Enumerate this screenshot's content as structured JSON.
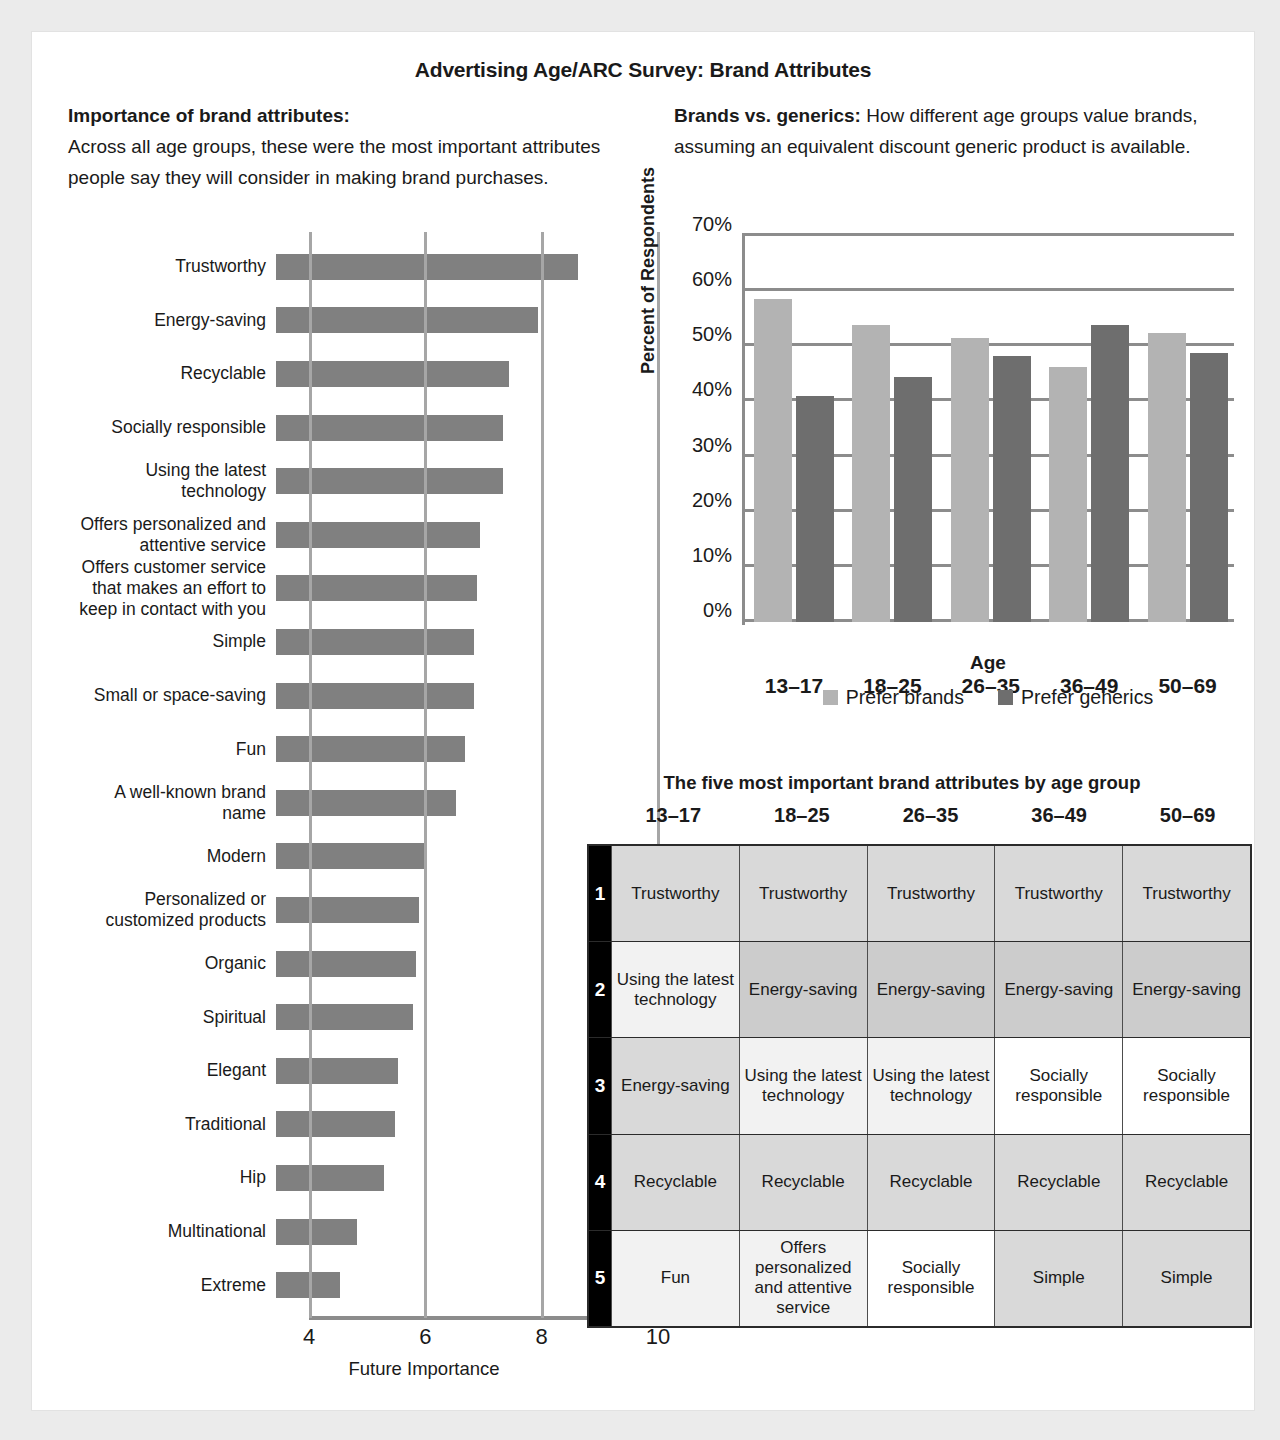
{
  "title": "Advertising Age/ARC Survey: Brand Attributes",
  "left_intro": {
    "heading": "Importance of brand attributes:",
    "body": "Across all age groups, these were the most important attributes people say they will consider in making brand purchases."
  },
  "right_intro": {
    "heading": "Brands vs. generics:",
    "body": " How different age groups value brands, assuming an equivalent discount generic product is available."
  },
  "table_section": {
    "title": "The five most important brand attributes by age group",
    "columns": [
      "13–17",
      "18–25",
      "26–35",
      "36–49",
      "50–69"
    ],
    "ranks": [
      "1",
      "2",
      "3",
      "4",
      "5"
    ],
    "rows": [
      {
        "rank": "1",
        "cells": [
          {
            "text": "Trustworthy",
            "shade": 2
          },
          {
            "text": "Trustworthy",
            "shade": 2
          },
          {
            "text": "Trustworthy",
            "shade": 2
          },
          {
            "text": "Trustworthy",
            "shade": 2
          },
          {
            "text": "Trustworthy",
            "shade": 2
          }
        ]
      },
      {
        "rank": "2",
        "cells": [
          {
            "text": "Using the latest technology",
            "shade": 1
          },
          {
            "text": "Energy-saving",
            "shade": 3
          },
          {
            "text": "Energy-saving",
            "shade": 3
          },
          {
            "text": "Energy-saving",
            "shade": 3
          },
          {
            "text": "Energy-saving",
            "shade": 3
          }
        ]
      },
      {
        "rank": "3",
        "cells": [
          {
            "text": "Energy-saving",
            "shade": 2
          },
          {
            "text": "Using the latest technology",
            "shade": 1
          },
          {
            "text": "Using the latest technology",
            "shade": 1
          },
          {
            "text": "Socially responsible",
            "shade": 0
          },
          {
            "text": "Socially responsible",
            "shade": 0
          }
        ]
      },
      {
        "rank": "4",
        "cells": [
          {
            "text": "Recyclable",
            "shade": 2
          },
          {
            "text": "Recyclable",
            "shade": 2
          },
          {
            "text": "Recyclable",
            "shade": 2
          },
          {
            "text": "Recyclable",
            "shade": 2
          },
          {
            "text": "Recyclable",
            "shade": 2
          }
        ]
      },
      {
        "rank": "5",
        "cells": [
          {
            "text": "Fun",
            "shade": 1
          },
          {
            "text": "Offers personalized and attentive service",
            "shade": 1
          },
          {
            "text": "Socially responsible",
            "shade": 0
          },
          {
            "text": "Simple",
            "shade": 2
          },
          {
            "text": "Simple",
            "shade": 2
          }
        ]
      }
    ]
  },
  "chart_data": [
    {
      "id": "future-importance",
      "type": "bar",
      "orientation": "horizontal",
      "title": "Importance of brand attributes",
      "xlabel": "Future Importance",
      "ylabel": "",
      "xlim": [
        4,
        10
      ],
      "xticks": [
        4,
        6,
        8,
        10
      ],
      "grid": true,
      "bar_color": "#808080",
      "categories": [
        "Trustworthy",
        "Energy-saving",
        "Recyclable",
        "Socially responsible",
        "Using the latest technology",
        "Offers personalized and attentive service",
        "Offers customer service that makes an effort to keep in contact with you",
        "Simple",
        "Small or space-saving",
        "Fun",
        "A well-known brand name",
        "Modern",
        "Personalized or customized products",
        "Organic",
        "Spiritual",
        "Elegant",
        "Traditional",
        "Hip",
        "Multinational",
        "Extreme"
      ],
      "values": [
        9.2,
        8.5,
        8.0,
        7.9,
        7.9,
        7.5,
        7.45,
        7.4,
        7.4,
        7.25,
        7.1,
        6.6,
        6.45,
        6.4,
        6.35,
        6.1,
        6.05,
        5.85,
        5.4,
        5.1
      ],
      "label_lines": [
        [
          "Trustworthy"
        ],
        [
          "Energy-saving"
        ],
        [
          "Recyclable"
        ],
        [
          "Socially responsible"
        ],
        [
          "Using the latest",
          "technology"
        ],
        [
          "Offers personalized and",
          "attentive service"
        ],
        [
          "Offers customer service",
          "that makes an effort to",
          "keep in contact with you"
        ],
        [
          "Simple"
        ],
        [
          "Small or space-saving"
        ],
        [
          "Fun"
        ],
        [
          "A well-known brand name"
        ],
        [
          "Modern"
        ],
        [
          "Personalized or",
          "customized products"
        ],
        [
          "Organic"
        ],
        [
          "Spiritual"
        ],
        [
          "Elegant"
        ],
        [
          "Traditional"
        ],
        [
          "Hip"
        ],
        [
          "Multinational"
        ],
        [
          "Extreme"
        ]
      ]
    },
    {
      "id": "brands-vs-generics",
      "type": "bar",
      "orientation": "vertical",
      "title": "Brands vs. generics",
      "xlabel": "Age",
      "ylabel": "Percent of Respondents",
      "ylim": [
        0,
        70
      ],
      "yticks": [
        0,
        10,
        20,
        30,
        40,
        50,
        60,
        70
      ],
      "ytick_labels": [
        "0%",
        "10%",
        "20%",
        "30%",
        "40%",
        "50%",
        "60%",
        "70%"
      ],
      "grid": true,
      "legend_position": "bottom",
      "categories": [
        "13–17",
        "18–25",
        "26–35",
        "36–49",
        "50–69"
      ],
      "series": [
        {
          "name": "Prefer brands",
          "color": "#b3b3b3",
          "values": [
            58.5,
            53.8,
            51.5,
            46.3,
            52.5
          ]
        },
        {
          "name": "Prefer generics",
          "color": "#6e6e6e",
          "values": [
            41.0,
            44.5,
            48.2,
            53.8,
            48.8
          ]
        }
      ]
    }
  ]
}
